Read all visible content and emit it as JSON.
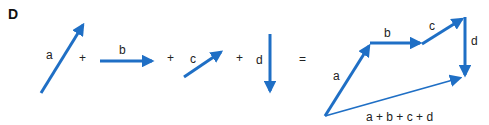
{
  "figure": {
    "panel_label": "D",
    "arrow_color": "#1f6fc5",
    "text_color": "#222222",
    "equation": {
      "operators": [
        "+",
        "+",
        "+",
        "="
      ],
      "vectors": [
        {
          "id": "a",
          "label": "a"
        },
        {
          "id": "b",
          "label": "b"
        },
        {
          "id": "c",
          "label": "c"
        },
        {
          "id": "d",
          "label": "d"
        }
      ]
    },
    "sum_diagram": {
      "chain_labels": [
        "a",
        "b",
        "c",
        "d"
      ],
      "resultant_label": "a + b + c + d"
    }
  }
}
